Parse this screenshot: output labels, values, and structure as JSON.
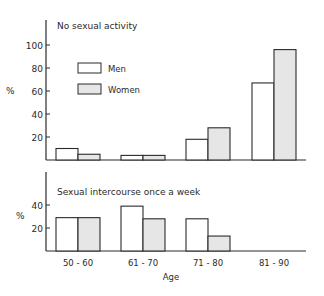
{
  "chart_data": [
    {
      "type": "bar",
      "title": "No sexual activity",
      "xlabel": "",
      "ylabel": "%",
      "ylim": [
        0,
        110
      ],
      "yticks": [
        20,
        40,
        60,
        80,
        100
      ],
      "grid": false,
      "legend": {
        "position": "upper-left-inside",
        "entries": [
          "Men",
          "Women"
        ]
      },
      "categories": [
        "50 - 60",
        "61 - 70",
        "71 - 80",
        "81 - 90"
      ],
      "series": [
        {
          "name": "Men",
          "fill": "#ffffff",
          "values": [
            10,
            4,
            18,
            67
          ]
        },
        {
          "name": "Women",
          "fill": "#e6e6e6",
          "values": [
            5,
            4,
            28,
            96
          ]
        }
      ]
    },
    {
      "type": "bar",
      "title": "Sexual intercourse once a week",
      "xlabel": "Age",
      "ylabel": "%",
      "ylim": [
        0,
        60
      ],
      "yticks": [
        20,
        40
      ],
      "grid": false,
      "categories": [
        "50 - 60",
        "61 - 70",
        "71 - 80",
        "81 - 90"
      ],
      "series": [
        {
          "name": "Men",
          "fill": "#ffffff",
          "values": [
            29,
            39,
            28,
            0
          ]
        },
        {
          "name": "Women",
          "fill": "#e6e6e6",
          "values": [
            29,
            28,
            13,
            0
          ]
        }
      ]
    }
  ],
  "labels": {
    "top_title": "No sexual activity",
    "bottom_title": "Sexual intercourse once a week",
    "y_unit": "%",
    "x_axis_title": "Age",
    "legend_men": "Men",
    "legend_women": "Women",
    "top_ticks": [
      "100",
      "80",
      "60",
      "40",
      "20"
    ],
    "bottom_ticks": [
      "40",
      "20"
    ],
    "categories": [
      "50 - 60",
      "61 - 70",
      "71 - 80",
      "81 - 90"
    ]
  },
  "colors": {
    "line": "#2a2a2a",
    "men_fill": "#ffffff",
    "women_fill": "#e6e6e6"
  }
}
